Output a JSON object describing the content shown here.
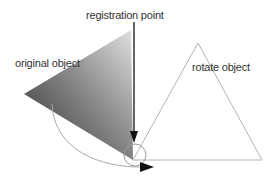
{
  "labels": {
    "registration": "registration point",
    "original": "original object",
    "rotated": "rotate object"
  },
  "colors": {
    "gradient_dark": "#3a3a3a",
    "gradient_light": "#d8d8d8",
    "outline": "#b0b0b0",
    "arrow": "#222222",
    "text": "#333333"
  }
}
